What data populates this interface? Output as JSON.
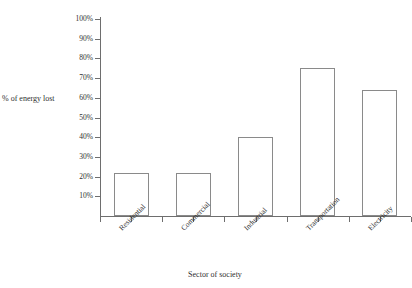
{
  "figure": {
    "top_clipped_text": "··········",
    "bar_outline_color": "#8a8a8a",
    "bar_fill_color": "#ffffff",
    "axis_color": "#6e6e6e",
    "text_color": "#2f2f2f",
    "background_color": "#ffffff"
  },
  "chart_data": {
    "type": "bar",
    "title": "",
    "xlabel": "Sector of society",
    "ylabel": "% of energy lost",
    "categories": [
      "Residential",
      "Commercial",
      "Industrial",
      "Transportation",
      "Electricity"
    ],
    "values": [
      22,
      22,
      40,
      75,
      64
    ],
    "ylim": [
      0,
      100
    ],
    "ytick_values": [
      10,
      20,
      30,
      40,
      50,
      60,
      70,
      80,
      90,
      100
    ],
    "ytick_labels": [
      "10%",
      "20%",
      "30%",
      "40%",
      "50%",
      "60%",
      "70%",
      "80%",
      "90%",
      "100%"
    ],
    "grid": false,
    "legend": false,
    "xtick_label_rotation": -45,
    "bar_style": "outline"
  }
}
